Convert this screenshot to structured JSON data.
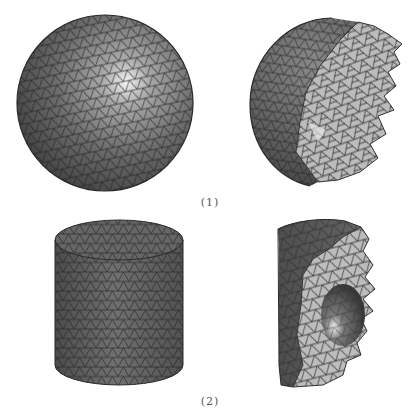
{
  "figure": {
    "rows": [
      {
        "label": "(1)",
        "shape": "sphere",
        "panels": [
          {
            "name": "sphere-surface-mesh",
            "view": "full"
          },
          {
            "name": "sphere-cutaway-mesh",
            "view": "section"
          }
        ]
      },
      {
        "label": "(2)",
        "shape": "cylinder",
        "panels": [
          {
            "name": "cylinder-surface-mesh",
            "view": "full"
          },
          {
            "name": "cylinder-cutaway-mesh",
            "view": "section-with-inner-void"
          }
        ]
      }
    ],
    "colors": {
      "background": "#ffffff",
      "surface_dark": "#5a5a5a",
      "surface_mid": "#7a7a7a",
      "section_light": "#bdbdbd",
      "highlight": "#f2f2f2",
      "edge": "#262626",
      "caption": "#555555"
    }
  }
}
